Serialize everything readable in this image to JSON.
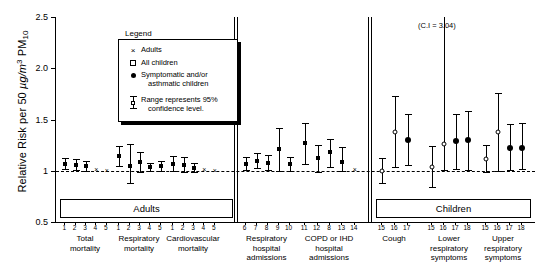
{
  "chart_data": {
    "type": "scatter",
    "title": "",
    "ylabel": "Relative Risk per 50 µg/m³ PM10",
    "ylabel_parts": {
      "pre": "Relative Risk per 50 ",
      "unit_italic": "µg/m",
      "unit_sup": "3",
      "pm": " PM",
      "pm_sub": "10"
    },
    "xlabel": "",
    "ylim": [
      0.5,
      2.5
    ],
    "yticks": [
      "0.5",
      "1",
      "1.5",
      "2.0",
      "2.5"
    ],
    "ytick_values": [
      0.5,
      1.0,
      1.5,
      2.0,
      2.5
    ],
    "grid": false,
    "reference_line": 1.0,
    "annotation": "(C.I = 3.04)",
    "legend_position": "top-left",
    "legend": {
      "title": "Legend",
      "entries": [
        {
          "marker": "cross",
          "label": "Adults"
        },
        {
          "marker": "open-square",
          "label": "All children"
        },
        {
          "marker": "filled-circle",
          "label": "Symptomatic and/or",
          "label2": "asthmatic children"
        },
        {
          "marker": "error-bar",
          "label": "Range represents 95%",
          "label2": "confidence level."
        }
      ]
    },
    "panels": [
      {
        "name": "Adults",
        "banner": "Adults"
      },
      {
        "name": "Children",
        "banner": "Children"
      }
    ],
    "groups": [
      {
        "caption": [
          "Total",
          "mortality"
        ],
        "ticks": [
          "1",
          "2",
          "3",
          "4",
          "5"
        ],
        "panel": 0,
        "points": [
          {
            "tick": "1",
            "marker": "square",
            "value": 1.07,
            "low": 1.02,
            "high": 1.12
          },
          {
            "tick": "2",
            "marker": "square",
            "value": 1.06,
            "low": 1.01,
            "high": 1.11
          },
          {
            "tick": "3",
            "marker": "square",
            "value": 1.05,
            "low": 1.0,
            "high": 1.1
          },
          {
            "tick": "4",
            "marker": "cross",
            "value": 1.02,
            "low": null,
            "high": null
          },
          {
            "tick": "5",
            "marker": "cross",
            "value": 1.01,
            "low": null,
            "high": null
          }
        ]
      },
      {
        "caption": [
          "Respiratory",
          "mortality"
        ],
        "ticks": [
          "1",
          "2",
          "3",
          "4",
          "5"
        ],
        "panel": 0,
        "points": [
          {
            "tick": "1",
            "marker": "square",
            "value": 1.14,
            "low": 1.05,
            "high": 1.24
          },
          {
            "tick": "2",
            "marker": "square",
            "value": 1.05,
            "low": 0.88,
            "high": 1.26
          },
          {
            "tick": "3",
            "marker": "square",
            "value": 1.09,
            "low": 0.99,
            "high": 1.18
          },
          {
            "tick": "4",
            "marker": "square",
            "value": 1.04,
            "low": 1.0,
            "high": 1.08
          },
          {
            "tick": "5",
            "marker": "square",
            "value": 1.05,
            "low": 1.0,
            "high": 1.1
          }
        ]
      },
      {
        "caption": [
          "Cardiovascular",
          "mortality"
        ],
        "ticks": [
          "1",
          "2",
          "3",
          "4",
          "5"
        ],
        "panel": 0,
        "points": [
          {
            "tick": "1",
            "marker": "square",
            "value": 1.07,
            "low": 1.0,
            "high": 1.14
          },
          {
            "tick": "2",
            "marker": "square",
            "value": 1.06,
            "low": 0.99,
            "high": 1.13
          },
          {
            "tick": "3",
            "marker": "square",
            "value": 1.03,
            "low": 0.99,
            "high": 1.08
          },
          {
            "tick": "4",
            "marker": "cross",
            "value": 1.02,
            "low": null,
            "high": null
          },
          {
            "tick": "5",
            "marker": "cross",
            "value": 1.01,
            "low": null,
            "high": null
          }
        ]
      },
      {
        "caption": [
          "Respiratory",
          "hospital",
          "admissions"
        ],
        "ticks": [
          "6",
          "7",
          "8",
          "9",
          "10"
        ],
        "panel": 0,
        "points": [
          {
            "tick": "6",
            "marker": "square",
            "value": 1.07,
            "low": 1.01,
            "high": 1.13
          },
          {
            "tick": "7",
            "marker": "square",
            "value": 1.1,
            "low": 1.03,
            "high": 1.17
          },
          {
            "tick": "8",
            "marker": "square",
            "value": 1.08,
            "low": 1.01,
            "high": 1.15
          },
          {
            "tick": "9",
            "marker": "square",
            "value": 1.21,
            "low": 1.0,
            "high": 1.42
          },
          {
            "tick": "10",
            "marker": "square",
            "value": 1.07,
            "low": 1.0,
            "high": 1.13
          }
        ]
      },
      {
        "caption": [
          "COPD or IHD",
          "hospital",
          "admissions"
        ],
        "ticks": [
          "11",
          "12",
          "8",
          "13",
          "14"
        ],
        "panel": 0,
        "points": [
          {
            "tick": "11",
            "marker": "square",
            "value": 1.27,
            "low": 1.07,
            "high": 1.47
          },
          {
            "tick": "12",
            "marker": "square",
            "value": 1.12,
            "low": 0.99,
            "high": 1.25
          },
          {
            "tick": "8",
            "marker": "square",
            "value": 1.18,
            "low": 1.04,
            "high": 1.31
          },
          {
            "tick": "13",
            "marker": "square",
            "value": 1.09,
            "low": 1.0,
            "high": 1.23
          },
          {
            "tick": "14",
            "marker": "cross",
            "value": 1.02,
            "low": null,
            "high": null
          }
        ]
      },
      {
        "caption": [
          "Cough"
        ],
        "ticks": [
          "15",
          "16",
          "17"
        ],
        "panel": 1,
        "points": [
          {
            "tick": "15",
            "marker": "open",
            "value": 1.0,
            "low": 0.88,
            "high": 1.12
          },
          {
            "tick": "16",
            "marker": "open",
            "value": 1.38,
            "low": 1.04,
            "high": 1.73
          },
          {
            "tick": "17",
            "marker": "dot",
            "value": 1.3,
            "low": 1.06,
            "high": 1.55
          }
        ]
      },
      {
        "caption": [
          "Lower",
          "respiratory",
          "symptoms"
        ],
        "ticks": [
          "15",
          "16",
          "17",
          "18"
        ],
        "panel": 1,
        "points": [
          {
            "tick": "15",
            "marker": "open",
            "value": 1.04,
            "low": 0.84,
            "high": 1.24
          },
          {
            "tick": "16",
            "marker": "open",
            "value": 1.26,
            "low": 1.01,
            "high": 3.04
          },
          {
            "tick": "17",
            "marker": "dot",
            "value": 1.29,
            "low": 1.02,
            "high": 1.55
          },
          {
            "tick": "18",
            "marker": "dot",
            "value": 1.3,
            "low": 1.01,
            "high": 1.58
          }
        ]
      },
      {
        "caption": [
          "Upper",
          "respiratory",
          "symptoms"
        ],
        "ticks": [
          "15",
          "16",
          "17",
          "18"
        ],
        "panel": 1,
        "points": [
          {
            "tick": "15",
            "marker": "open",
            "value": 1.11,
            "low": 0.99,
            "high": 1.25
          },
          {
            "tick": "16",
            "marker": "open",
            "value": 1.38,
            "low": 1.0,
            "high": 1.76
          },
          {
            "tick": "17",
            "marker": "dot",
            "value": 1.22,
            "low": 1.01,
            "high": 1.46
          },
          {
            "tick": "18",
            "marker": "dot",
            "value": 1.22,
            "low": 1.02,
            "high": 1.47
          }
        ]
      }
    ]
  }
}
